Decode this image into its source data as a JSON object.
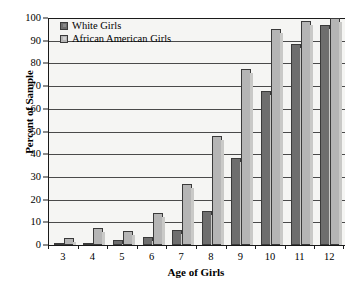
{
  "chart_data": {
    "type": "bar",
    "title": "",
    "xlabel": "Age of Girls",
    "ylabel": "Percent of Sample",
    "categories": [
      "3",
      "4",
      "5",
      "6",
      "7",
      "8",
      "9",
      "10",
      "11",
      "12"
    ],
    "series": [
      {
        "name": "White Girls",
        "color": "#6e6e6e",
        "values": [
          1,
          1,
          2,
          3.5,
          6.5,
          15,
          38.5,
          68,
          88.5,
          97
        ]
      },
      {
        "name": "African American Girls",
        "color": "#b5b5b5",
        "values": [
          3,
          7.5,
          6,
          14,
          27,
          48,
          77.5,
          95,
          98.5,
          100
        ]
      }
    ],
    "ylim": [
      0,
      100
    ],
    "yticks": [
      0,
      10,
      20,
      30,
      40,
      50,
      60,
      70,
      80,
      90,
      100
    ],
    "ytick_labels": [
      "0",
      "10",
      "20",
      "30",
      "40",
      "50",
      "60",
      "70",
      "80",
      "90",
      "100"
    ],
    "grid": true,
    "legend_position": "top-left"
  },
  "legend": {
    "entries": [
      {
        "label": "White Girls"
      },
      {
        "label": "African American Girls"
      }
    ]
  }
}
